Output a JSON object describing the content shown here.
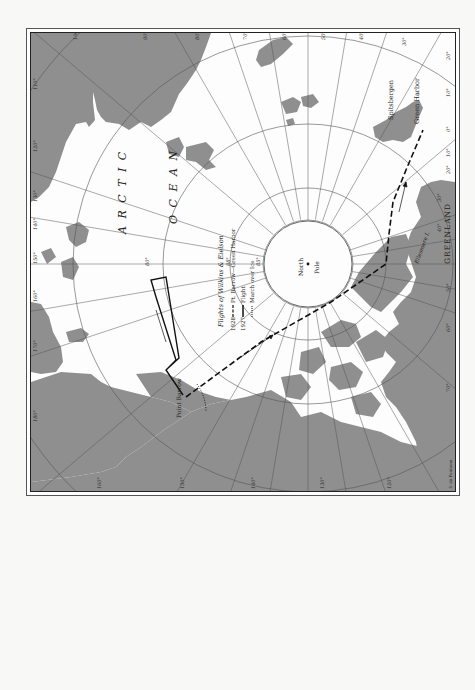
{
  "map": {
    "ocean_label_1": "A R C T I C",
    "ocean_label_2": "O C E A N",
    "pole_label_line1": "North",
    "pole_label_line2": "Pole",
    "places": {
      "spitsbergen": "Spitsbergen",
      "green_harbor": "Green Harbor",
      "greenland": "GREENLAND",
      "ellesmere": "Ellesmere I.",
      "point_barrow": "Point Barrow"
    },
    "credit": "© de Fontaine",
    "latitude_labels": [
      "88°",
      "85°",
      "80°"
    ],
    "longitude_labels_top": [
      "100°",
      "90°",
      "80°",
      "70°",
      "60°",
      "50°",
      "40°",
      "30°",
      "20°"
    ],
    "longitude_labels_right": [
      "10°",
      "0°",
      "10°",
      "20°",
      "30°",
      "40°",
      "50°",
      "60°",
      "70°"
    ],
    "longitude_labels_left": [
      "110°",
      "120°",
      "130°",
      "140°",
      "150°",
      "160°",
      "170°",
      "180°"
    ],
    "longitude_labels_bottom": [
      "160°",
      "150°",
      "140°",
      "130°",
      "120°"
    ]
  },
  "legend": {
    "title": "Flights of Wilkins & Eielson",
    "row1_year": "1928",
    "row1_text": "Pt. Barrow—Green Harbor",
    "row2_year": "1927",
    "row2_text": "Flight",
    "row3_text": "March over Ice"
  },
  "colors": {
    "land": "#8f8f8f",
    "water": "#fdfdfd",
    "grid": "#555555",
    "route": "#111111"
  }
}
